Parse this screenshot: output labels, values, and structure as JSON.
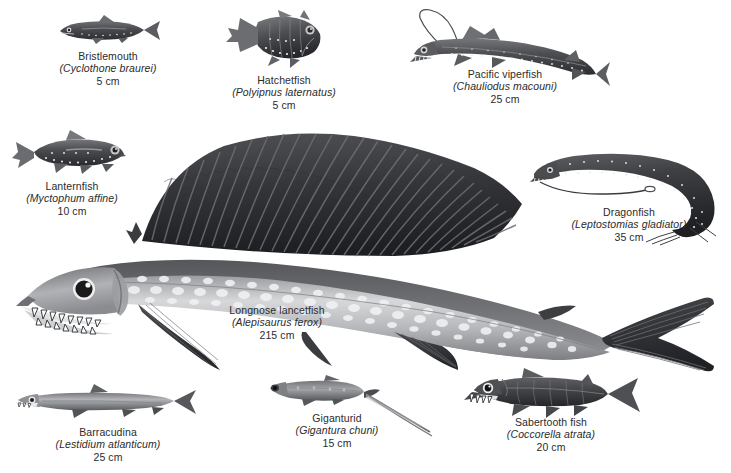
{
  "plate": {
    "background_color": "#ffffff",
    "text_color": "#2b2b2b",
    "width": 731,
    "height": 473,
    "subject": "deep-sea fishes illustration plate"
  },
  "specimens": [
    {
      "id": "bristlemouth",
      "common_name": "Bristlemouth",
      "scientific_name": "(Cyclothone braurei)",
      "size": "5 cm",
      "icon": "bristlemouth-fish-icon"
    },
    {
      "id": "hatchetfish",
      "common_name": "Hatchetfish",
      "scientific_name": "(Polyipnus laternatus)",
      "size": "5 cm",
      "icon": "hatchetfish-fish-icon"
    },
    {
      "id": "pacific-viperfish",
      "common_name": "Pacific viperfish",
      "scientific_name": "(Chauliodus macouni)",
      "size": "25 cm",
      "icon": "viperfish-fish-icon"
    },
    {
      "id": "lanternfish",
      "common_name": "Lanternfish",
      "scientific_name": "(Myctophum affine)",
      "size": "10 cm",
      "icon": "lanternfish-fish-icon"
    },
    {
      "id": "dragonfish",
      "common_name": "Dragonfish",
      "scientific_name": "(Leptostomias gladiator)",
      "size": "35 cm",
      "icon": "dragonfish-fish-icon"
    },
    {
      "id": "longnose-lancetfish",
      "common_name": "Longnose lancetfish",
      "scientific_name": "(Alepisaurus ferox)",
      "size": "215 cm",
      "icon": "lancetfish-fish-icon"
    },
    {
      "id": "barracudina",
      "common_name": "Barracudina",
      "scientific_name": "(Lestidium atlanticum)",
      "size": "25 cm",
      "icon": "barracudina-fish-icon"
    },
    {
      "id": "giganturid",
      "common_name": "Giganturid",
      "scientific_name": "(Gigantura chuni)",
      "size": "15 cm",
      "icon": "giganturid-fish-icon"
    },
    {
      "id": "sabertooth-fish",
      "common_name": "Sabertooth fish",
      "scientific_name": "(Coccorella atrata)",
      "size": "20 cm",
      "icon": "sabertooth-fish-icon"
    }
  ]
}
